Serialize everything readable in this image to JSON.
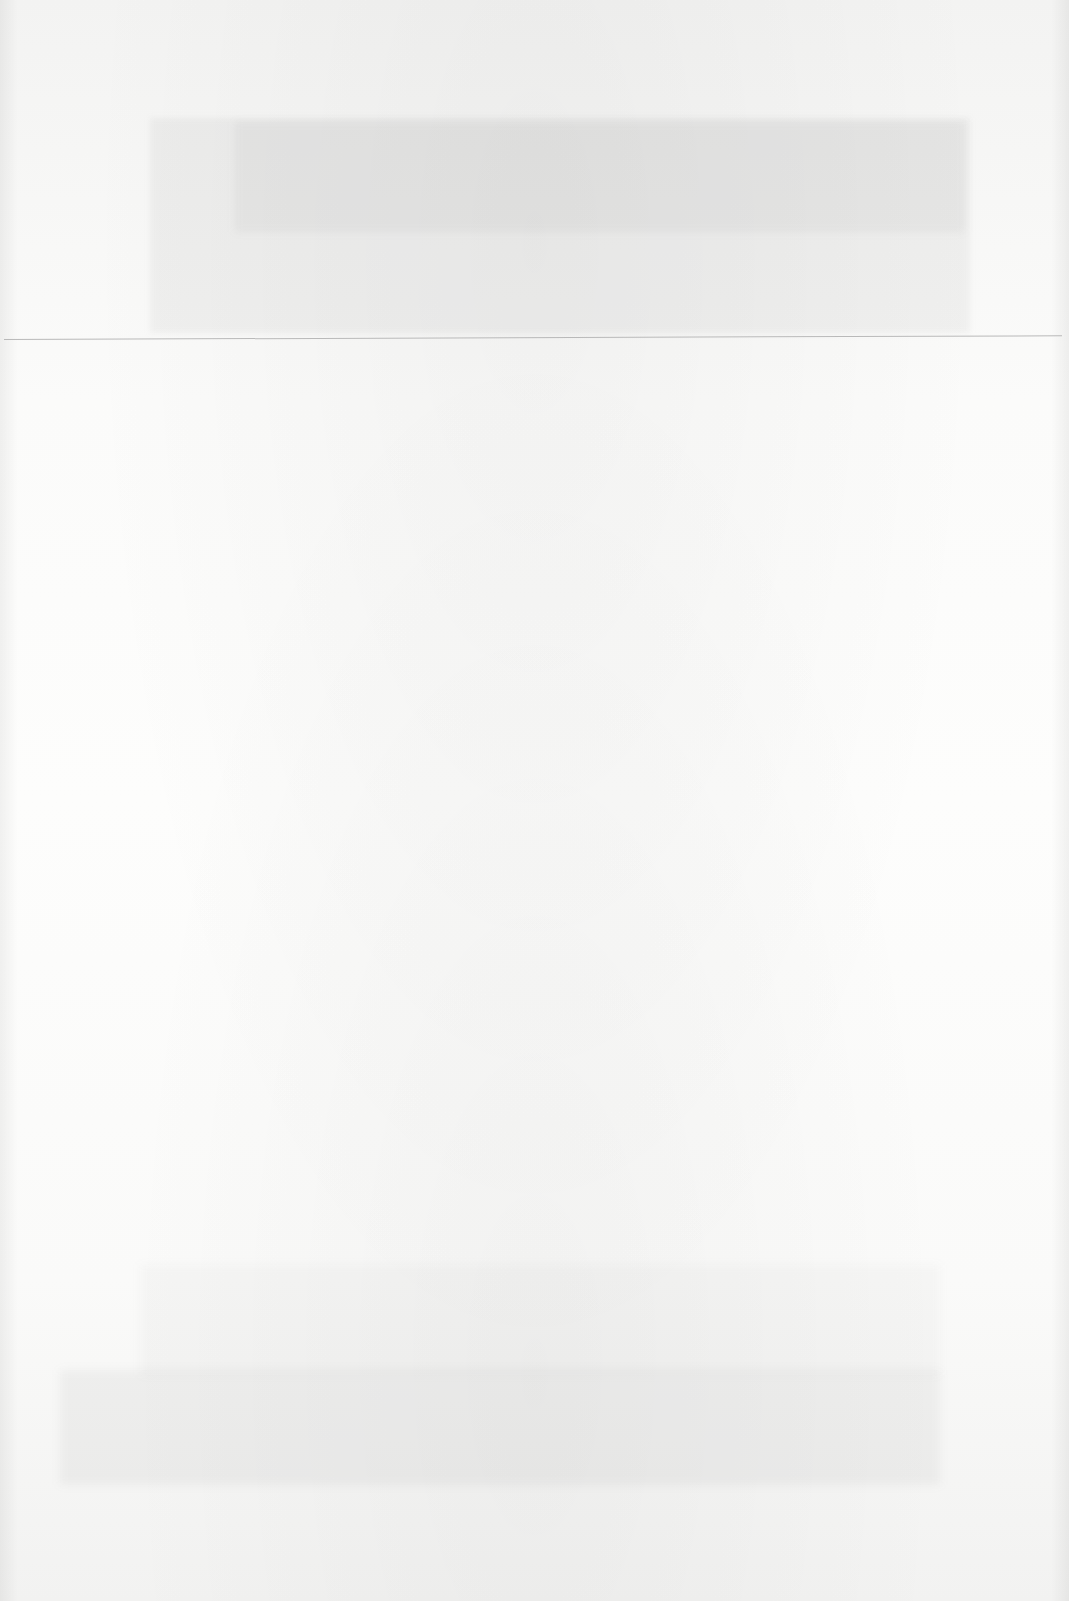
{
  "document": {
    "type": "scanned-page",
    "content": "",
    "colors": {
      "paper": "#fbfbfa",
      "rule": "#b9b9b9",
      "bleed_through": "#787878"
    }
  }
}
